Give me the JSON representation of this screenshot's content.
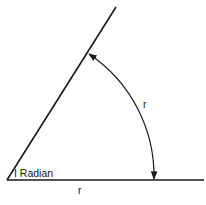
{
  "figure": {
    "angle_label": "I Radian",
    "arc_label": "r",
    "base_label": "r",
    "colors": {
      "line": "#1a1a1a",
      "background": "#ffffff"
    }
  },
  "geometry": {
    "vertex": [
      7,
      180
    ],
    "base_end": [
      204,
      180
    ],
    "ray_end": [
      116,
      7
    ],
    "radius": 147,
    "arc_start": [
      154,
      180
    ],
    "arc_end": [
      88,
      53
    ]
  }
}
